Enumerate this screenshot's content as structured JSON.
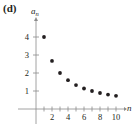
{
  "panel_label": "(d)",
  "chart_data": {
    "type": "scatter",
    "title": "",
    "xlabel": "n",
    "ylabel": "a_n",
    "ylabel_main": "a",
    "ylabel_sub": "n",
    "x": [
      1,
      2,
      3,
      4,
      5,
      6,
      7,
      8,
      9,
      10
    ],
    "series": [
      {
        "name": "a_n",
        "values": [
          4,
          2.67,
          2,
          1.6,
          1.33,
          1.14,
          1,
          0.89,
          0.8,
          0.73
        ]
      }
    ],
    "xlim": [
      0,
      11
    ],
    "ylim": [
      0,
      4.5
    ],
    "x_ticks": [
      1,
      2,
      3,
      4,
      5,
      6,
      7,
      8,
      9,
      10
    ],
    "x_tick_labels": [
      "2",
      "4",
      "6",
      "8",
      "10"
    ],
    "x_tick_label_values": [
      2,
      4,
      6,
      8,
      10
    ],
    "y_ticks": [
      1,
      2,
      3,
      4
    ],
    "y_tick_labels": [
      "1",
      "2",
      "3",
      "4"
    ],
    "grid": false,
    "legend": "none",
    "colors": {
      "points": "#231f20",
      "axes": "#8c8c8c"
    }
  }
}
